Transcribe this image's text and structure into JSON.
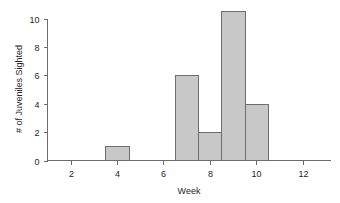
{
  "chart_data": {
    "type": "bar",
    "title": "",
    "subtitle": "",
    "xlabel": "Week",
    "ylabel": "# of Juveniles Sighted",
    "x": [
      4,
      7,
      8,
      9,
      10
    ],
    "values": [
      1,
      6,
      2,
      10.5,
      4
    ],
    "categories": [
      "4",
      "7",
      "8",
      "9",
      "10"
    ],
    "bar_width_weeks": 1,
    "xlim": [
      1,
      13.2
    ],
    "ylim": [
      0,
      10.8
    ],
    "xticks": [
      2,
      4,
      6,
      8,
      10,
      12
    ],
    "xtick_labels": [
      "2",
      "4",
      "6",
      "8",
      "10",
      "12"
    ],
    "yticks": [
      0,
      2,
      4,
      6,
      8,
      10
    ],
    "ytick_labels": [
      "0",
      "2",
      "4",
      "6",
      "8",
      "10"
    ],
    "grid": false,
    "legend": false,
    "legend_position": "none",
    "annotations": [],
    "series": [
      {
        "name": "# of Juveniles Sighted",
        "x": [
          4,
          7,
          8,
          9,
          10
        ],
        "values": [
          1,
          6,
          2,
          10.5,
          4
        ]
      }
    ]
  },
  "style": {
    "bar_fill": "#c8c8c8",
    "bar_stroke": "#6e6e6e",
    "axis_color": "#6b6b6b",
    "text_color": "#262626",
    "background": "#ffffff"
  }
}
